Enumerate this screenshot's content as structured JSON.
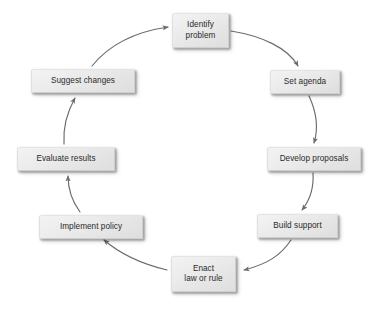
{
  "diagram": {
    "type": "cycle-flowchart",
    "title": "",
    "background_color": "#ffffff",
    "node_fill_color": "#eaeaea",
    "node_border_color": "#cfcfcf",
    "node_text_color": "#2a2a2a",
    "arrow_color": "#6b6b6b",
    "direction": "clockwise",
    "nodes": [
      {
        "id": "identify-problem",
        "label": "Identify\nproblem",
        "x": 172,
        "y": 13,
        "w": 57,
        "h": 35
      },
      {
        "id": "set-agenda",
        "label": "Set agenda",
        "x": 270,
        "y": 70,
        "w": 70,
        "h": 24
      },
      {
        "id": "develop-proposals",
        "label": "Develop proposals",
        "x": 267,
        "y": 147,
        "w": 94,
        "h": 24
      },
      {
        "id": "build-support",
        "label": "Build support",
        "x": 257,
        "y": 214,
        "w": 81,
        "h": 24
      },
      {
        "id": "enact-law-or-rule",
        "label": "Enact\nlaw or rule",
        "x": 171,
        "y": 256,
        "w": 65,
        "h": 36
      },
      {
        "id": "implement-policy",
        "label": "Implement policy",
        "x": 39,
        "y": 215,
        "w": 104,
        "h": 24
      },
      {
        "id": "evaluate-results",
        "label": "Evaluate results",
        "x": 17,
        "y": 147,
        "w": 98,
        "h": 24
      },
      {
        "id": "suggest-changes",
        "label": "Suggest changes",
        "x": 31,
        "y": 69,
        "w": 104,
        "h": 24
      }
    ],
    "edges": [
      {
        "id": "edge-identify-to-agenda",
        "from": "identify-problem",
        "to": "set-agenda"
      },
      {
        "id": "edge-agenda-to-develop",
        "from": "set-agenda",
        "to": "develop-proposals"
      },
      {
        "id": "edge-develop-to-build",
        "from": "develop-proposals",
        "to": "build-support"
      },
      {
        "id": "edge-build-to-enact",
        "from": "build-support",
        "to": "enact-law-or-rule"
      },
      {
        "id": "edge-enact-to-implement",
        "from": "enact-law-or-rule",
        "to": "implement-policy"
      },
      {
        "id": "edge-implement-to-evaluate",
        "from": "implement-policy",
        "to": "evaluate-results"
      },
      {
        "id": "edge-evaluate-to-suggest",
        "from": "evaluate-results",
        "to": "suggest-changes"
      },
      {
        "id": "edge-suggest-to-identify",
        "from": "suggest-changes",
        "to": "identify-problem"
      }
    ]
  }
}
